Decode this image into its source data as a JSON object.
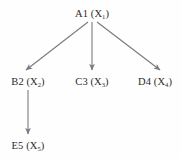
{
  "diagram": {
    "type": "tree",
    "background_color": "#fefefe",
    "edge_color": "#7a7a7a",
    "text_color": "#2b2b2b",
    "nodes": [
      {
        "id": "A1",
        "name": "A1",
        "variable": "X",
        "subscript": "1",
        "label": "A1 (X1)",
        "x": 92,
        "y": 13
      },
      {
        "id": "B2",
        "name": "B2",
        "variable": "X",
        "subscript": "2",
        "label": "B2 (X2)",
        "x": 28,
        "y": 81
      },
      {
        "id": "C3",
        "name": "C3",
        "variable": "X",
        "subscript": "3",
        "label": "C3 (X3)",
        "x": 92,
        "y": 81
      },
      {
        "id": "D4",
        "name": "D4",
        "variable": "X",
        "subscript": "4",
        "label": "D4 (X4)",
        "x": 155,
        "y": 81
      },
      {
        "id": "E5",
        "name": "E5",
        "variable": "X",
        "subscript": "5",
        "label": "E5 (X5)",
        "x": 28,
        "y": 145
      }
    ],
    "edges": [
      {
        "id": "A1-B2",
        "from": "A1",
        "to": "B2",
        "x1": 88,
        "y1": 22,
        "x2": 26,
        "y2": 70,
        "arrow": "end"
      },
      {
        "id": "A1-C3",
        "from": "A1",
        "to": "C3",
        "x1": 92,
        "y1": 22,
        "x2": 92,
        "y2": 70,
        "arrow": "end"
      },
      {
        "id": "A1-D4",
        "from": "A1",
        "to": "D4",
        "x1": 97,
        "y1": 22,
        "x2": 160,
        "y2": 70,
        "arrow": "end"
      },
      {
        "id": "B2-E5",
        "from": "B2",
        "to": "E5",
        "x1": 28,
        "y1": 90,
        "x2": 28,
        "y2": 134,
        "arrow": "end"
      }
    ]
  }
}
